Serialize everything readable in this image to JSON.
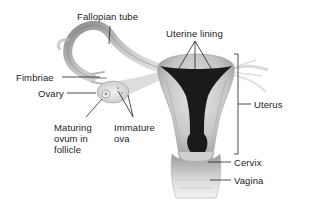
{
  "diagram": {
    "labels": {
      "fallopian_tube": "Fallopian tube",
      "uterine_lining": "Uterine lining",
      "fimbriae": "Fimbriae",
      "ovary": "Ovary",
      "uterus": "Uterus",
      "maturing_ovum_l1": "Maturing",
      "maturing_ovum_l2": "ovum in",
      "maturing_ovum_l3": "follicle",
      "immature_ova_l1": "Immature",
      "immature_ova_l2": "ova",
      "cervix": "Cervix",
      "vagina": "Vagina"
    },
    "colors": {
      "background": "#ffffff",
      "tissue_light": "#d9d9d9",
      "tissue_mid": "#a8a8a8",
      "lining_dark": "#1a1a1a",
      "leader_line": "#222222",
      "text": "#222222"
    }
  }
}
